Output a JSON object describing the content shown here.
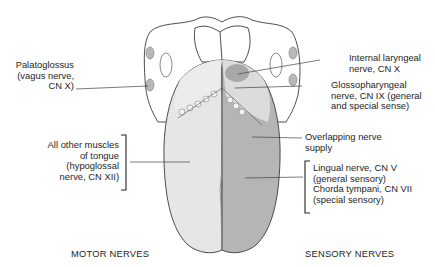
{
  "diagram": {
    "colors": {
      "motor_side": "#e6e6e6",
      "sensory_side": "#b5b5b5",
      "internal_laryngeal_region": "#b0b0b0",
      "glossopharyngeal_region": "#dcdcdc",
      "outline": "#3a3a3a",
      "leader_line": "#444444"
    },
    "left_labels": [
      {
        "id": "palatoglossus",
        "lines": [
          "Palatoglossus",
          "(vagus nerve,",
          "CN X)"
        ]
      },
      {
        "id": "hypoglossal",
        "lines": [
          "All other muscles",
          "of tongue",
          "(hypoglossal",
          "nerve, CN XII)"
        ],
        "bracket": true
      }
    ],
    "right_labels": [
      {
        "id": "internal-laryngeal",
        "lines": [
          "Internal laryngeal",
          "nerve, CN X"
        ]
      },
      {
        "id": "glossopharyngeal",
        "lines": [
          "Glossopharyngeal",
          "nerve, CN IX (general",
          "and special sense)"
        ]
      },
      {
        "id": "overlapping",
        "lines": [
          "Overlapping nerve",
          "supply"
        ]
      },
      {
        "id": "lingual-chorda",
        "lines": [
          "Lingual nerve, CN V",
          "(general sensory)",
          "Chorda tympani, CN VII",
          "(special sensory)"
        ],
        "bracket": true
      }
    ],
    "footer": {
      "left": "MOTOR NERVES",
      "right": "SENSORY NERVES"
    }
  }
}
